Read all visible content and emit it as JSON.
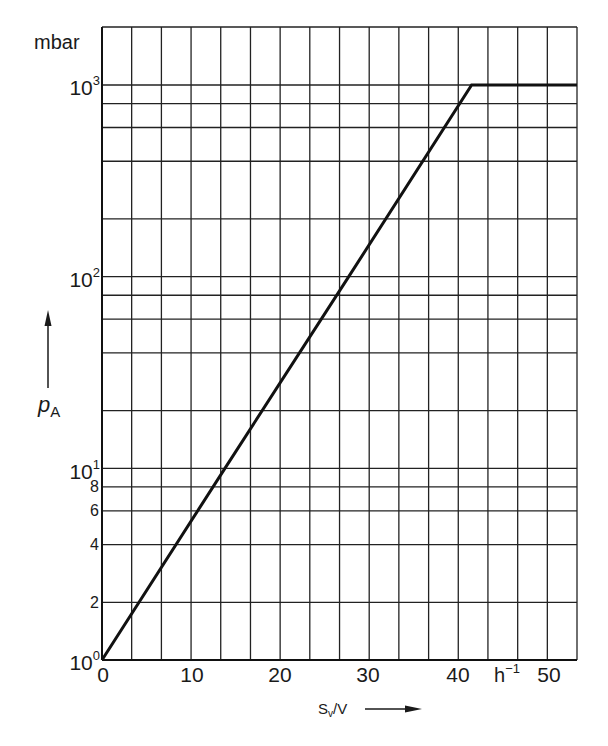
{
  "chart_data": {
    "type": "line",
    "title": "",
    "xlabel": "S_v/V",
    "x_unit": "h^-1",
    "ylabel": "p_A",
    "y_unit": "mbar",
    "y_scale": "log",
    "xlim": [
      0,
      53.33
    ],
    "ylim": [
      1,
      1000
    ],
    "grid": true,
    "x_ticks": [
      0,
      10,
      20,
      30,
      40,
      50
    ],
    "x_tick_labels": [
      "0",
      "10",
      "20",
      "30",
      "40",
      "50"
    ],
    "x_gridlines": [
      0,
      3.33,
      6.67,
      10,
      13.33,
      16.67,
      20,
      23.33,
      26.67,
      30,
      33.33,
      36.67,
      40,
      43.33,
      46.67,
      50,
      53.33
    ],
    "y_major_ticks": [
      1,
      10,
      100,
      1000
    ],
    "y_major_tick_labels": [
      "10^0",
      "10^1",
      "10^2",
      "10^3"
    ],
    "y_minor_labeled": [
      2,
      4,
      6,
      8
    ],
    "y_gridlines": [
      1,
      2,
      4,
      6,
      8,
      10,
      20,
      40,
      60,
      80,
      100,
      200,
      400,
      600,
      800,
      1000
    ],
    "series": [
      {
        "name": "p_A vs S_v/V",
        "x": [
          0,
          13.8,
          27.7,
          41.5,
          53.33
        ],
        "y": [
          1,
          10,
          100,
          1000,
          1000
        ]
      }
    ],
    "legend": null
  },
  "labels": {
    "y_unit": "mbar",
    "y_var_main": "p",
    "y_var_sub": "A",
    "x_var_main": "S",
    "x_var_sub": "v",
    "x_var_rest": "/V",
    "x_unit_main": "h",
    "x_unit_sup": "−1",
    "ytick_base": "10",
    "ytick_exp": [
      "0",
      "1",
      "2",
      "3"
    ],
    "ytick_minor": [
      "2",
      "4",
      "6",
      "8"
    ],
    "xticks": [
      "0",
      "10",
      "20",
      "30",
      "40",
      "50"
    ]
  }
}
